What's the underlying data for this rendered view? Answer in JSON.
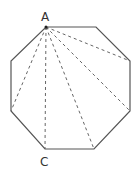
{
  "diagram": {
    "type": "octagon-diagonals",
    "shape": "regular octagon",
    "vertices": [
      {
        "id": "A",
        "x": 46,
        "y": 27,
        "label": "A"
      },
      {
        "id": "V2",
        "x": 96,
        "y": 27
      },
      {
        "id": "V3",
        "x": 130,
        "y": 61
      },
      {
        "id": "V4",
        "x": 130,
        "y": 111
      },
      {
        "id": "V5",
        "x": 94,
        "y": 149
      },
      {
        "id": "C",
        "x": 45,
        "y": 149,
        "label": "C"
      },
      {
        "id": "V7",
        "x": 11,
        "y": 111
      },
      {
        "id": "V8",
        "x": 11,
        "y": 61
      }
    ],
    "diagonals_from": "A",
    "diagonal_count": 5,
    "labels": {
      "a": "A",
      "c": "C"
    },
    "colors": {
      "stroke": "#555555",
      "dashed": "#666666",
      "text": "#333333"
    }
  }
}
